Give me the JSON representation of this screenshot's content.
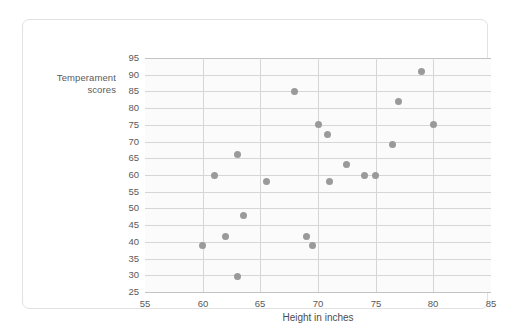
{
  "chart_data": {
    "type": "scatter",
    "title": "",
    "xlabel": "Height in inches",
    "ylabel": "Temperament scores",
    "ylabel_line1": "Temperament",
    "ylabel_line2": "scores",
    "xlim": [
      55,
      85
    ],
    "ylim": [
      25,
      95
    ],
    "xticks": [
      55,
      60,
      65,
      70,
      75,
      80,
      85
    ],
    "yticks": [
      25,
      30,
      35,
      40,
      45,
      50,
      55,
      60,
      65,
      70,
      75,
      80,
      85,
      90,
      95
    ],
    "grid": true,
    "legend": "none",
    "point_color": "#9a9a9a",
    "grid_color": "#d6d6d6",
    "plot_background": "#fbfbfb",
    "points": [
      {
        "x": 60.0,
        "y": 39
      },
      {
        "x": 61.0,
        "y": 60
      },
      {
        "x": 62.0,
        "y": 41.5
      },
      {
        "x": 63.0,
        "y": 29.5
      },
      {
        "x": 63.0,
        "y": 66
      },
      {
        "x": 63.5,
        "y": 48
      },
      {
        "x": 65.5,
        "y": 58
      },
      {
        "x": 68.0,
        "y": 85
      },
      {
        "x": 69.0,
        "y": 41.5
      },
      {
        "x": 69.5,
        "y": 39
      },
      {
        "x": 70.0,
        "y": 75
      },
      {
        "x": 70.8,
        "y": 72
      },
      {
        "x": 71.0,
        "y": 58
      },
      {
        "x": 72.5,
        "y": 63
      },
      {
        "x": 74.0,
        "y": 60
      },
      {
        "x": 75.0,
        "y": 60
      },
      {
        "x": 76.5,
        "y": 69
      },
      {
        "x": 77.0,
        "y": 82
      },
      {
        "x": 79.0,
        "y": 91
      },
      {
        "x": 80.0,
        "y": 75
      }
    ]
  }
}
